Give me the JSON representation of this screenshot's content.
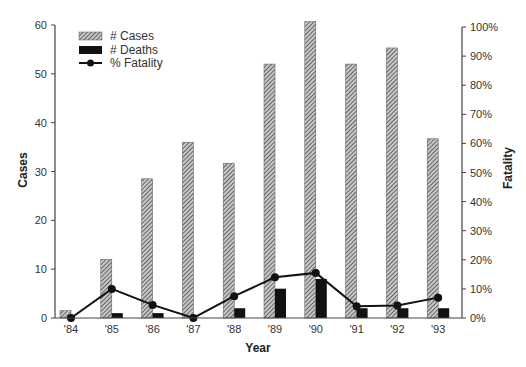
{
  "chart_data": {
    "type": "bar",
    "title": "",
    "xlabel": "Year",
    "ylabel": "Cases",
    "y2label": "Fatality",
    "categories": [
      "'84",
      "'85",
      "'86",
      "'87",
      "'88",
      "'89",
      "'90",
      "'91",
      "'92",
      "'93"
    ],
    "series": [
      {
        "name": "# Cases",
        "type": "bar",
        "axis": "left",
        "pattern": "hatched",
        "values": [
          1.5,
          12,
          28.5,
          36,
          31.7,
          52,
          60.7,
          52,
          55.3,
          36.7
        ]
      },
      {
        "name": "# Deaths",
        "type": "bar",
        "axis": "left",
        "pattern": "solid",
        "values": [
          0,
          1,
          1,
          0,
          2,
          6,
          8,
          2,
          2,
          2
        ]
      },
      {
        "name": "% Fatality",
        "type": "line",
        "axis": "right",
        "marker": "circle",
        "values": [
          0,
          10,
          4.5,
          0,
          7.5,
          14,
          15.5,
          4,
          4.3,
          7
        ]
      }
    ],
    "ylim": [
      0,
      60
    ],
    "yticks": [
      0,
      10,
      20,
      30,
      40,
      50,
      60
    ],
    "y2lim": [
      0,
      100
    ],
    "y2ticks": [
      "0%",
      "10%",
      "20%",
      "30%",
      "40%",
      "50%",
      "60%",
      "70%",
      "80%",
      "90%",
      "100%"
    ],
    "grid": false,
    "legend_position": "upper-left"
  },
  "colors": {
    "axis": "#444444",
    "cases_fill": "#bbbbbb",
    "cases_hatch": "#333333",
    "deaths_fill": "#111111",
    "line": "#111111"
  }
}
